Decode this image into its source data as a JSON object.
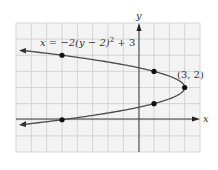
{
  "chart_data": {
    "type": "line",
    "title": "",
    "equation_label": "x = −2(y − 2)² + 3",
    "xlabel": "x",
    "ylabel": "y",
    "xlim": [
      -8,
      4
    ],
    "ylim": [
      -2,
      6
    ],
    "grid": true,
    "vertex_label": "(3, 2)",
    "points": [
      {
        "x": -5,
        "y": 4
      },
      {
        "x": 1,
        "y": 3
      },
      {
        "x": 3,
        "y": 2
      },
      {
        "x": 1,
        "y": 1
      },
      {
        "x": -5,
        "y": 0
      }
    ],
    "series": [
      {
        "name": "x = -2(y-2)^2 + 3",
        "curve": "parabola opening left",
        "vertex": [
          3,
          2
        ]
      }
    ]
  },
  "labels": {
    "equation": "x = −2(y − 2)",
    "equation_sup": "2",
    "equation_tail": " + 3",
    "x_axis": "x",
    "y_axis": "y",
    "vertex": "(3, 2)"
  },
  "colors": {
    "grid_bg": "#f2f2f2",
    "grid_line": "#c8c8c8",
    "curve": "#4a4a4a",
    "axis": "#3a3a3a",
    "point": "#111111"
  }
}
